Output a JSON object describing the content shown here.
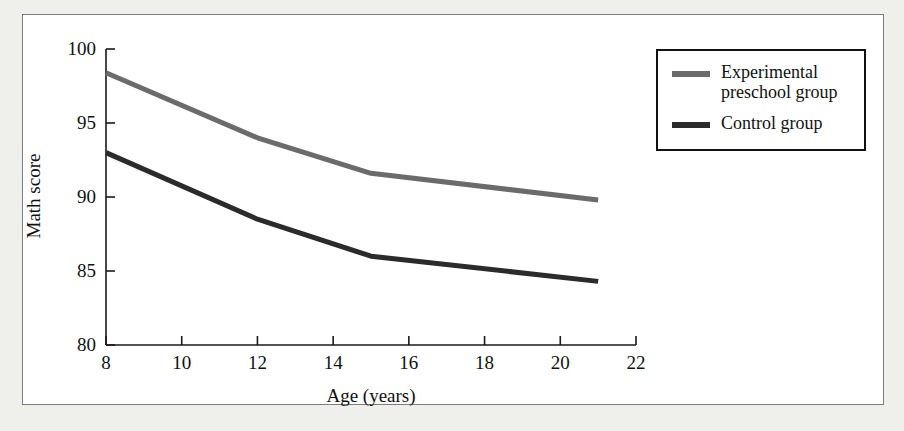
{
  "figure": {
    "background_color": "#efefec",
    "panel_color": "#ffffff",
    "panel_border_color": "#7d7d7d"
  },
  "legend": {
    "position": "top-right",
    "border_color": "#111111",
    "entries": [
      {
        "label": "Experimental preschool group",
        "color": "#6b6b6b"
      },
      {
        "label": "Control group",
        "color": "#2b2b2b"
      }
    ]
  },
  "chart_data": {
    "type": "line",
    "title": "",
    "xlabel": "Age (years)",
    "ylabel": "Math score",
    "xlim": [
      8,
      22
    ],
    "ylim": [
      80,
      100
    ],
    "xticks": [
      8,
      10,
      12,
      14,
      16,
      18,
      20,
      22
    ],
    "xtick_labels": [
      "8",
      "10",
      "12",
      "14",
      "16",
      "18",
      "20",
      "22"
    ],
    "yticks": [
      80,
      85,
      90,
      95,
      100
    ],
    "ytick_labels": [
      "80",
      "85",
      "90",
      "95",
      "100"
    ],
    "grid": false,
    "legend_position": "upper right",
    "x": [
      8,
      12,
      15,
      21
    ],
    "series": [
      {
        "name": "Experimental preschool group",
        "color": "#6b6b6b",
        "values": [
          98.4,
          94.0,
          91.6,
          89.8
        ]
      },
      {
        "name": "Control group",
        "color": "#2b2b2b",
        "values": [
          93.0,
          88.5,
          86.0,
          84.3
        ]
      }
    ]
  }
}
